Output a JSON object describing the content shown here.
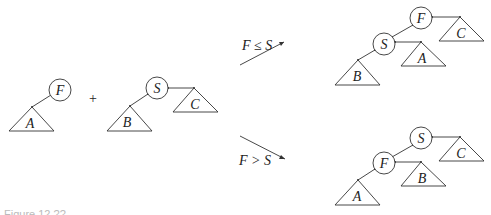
{
  "diagram": {
    "operator": "+",
    "left_tree": {
      "root": "F",
      "left_subtree": "A"
    },
    "right_tree": {
      "root": "S",
      "left_subtree": "B",
      "right_subtree": "C"
    },
    "branches": [
      {
        "condition": "F ≤ S",
        "result": {
          "root": "F",
          "left_child": "S",
          "right_subtree": "C",
          "S_left_subtree": "B",
          "S_right_subtree": "A"
        }
      },
      {
        "condition": "F > S",
        "result": {
          "root": "S",
          "left_child": "F",
          "right_subtree": "C",
          "F_left_subtree": "A",
          "F_right_subtree": "B"
        }
      }
    ],
    "caption": "Figure 12.??"
  },
  "labels": {
    "left_F": "F",
    "left_A": "A",
    "plus": "+",
    "mid_S": "S",
    "mid_B": "B",
    "mid_C": "C",
    "cond_top": "F ≤ S",
    "cond_bottom": "F > S",
    "top_F": "F",
    "top_S": "S",
    "top_C": "C",
    "top_A": "A",
    "top_B": "B",
    "bot_S": "S",
    "bot_F": "F",
    "bot_C": "C",
    "bot_B": "B",
    "bot_A": "A"
  }
}
